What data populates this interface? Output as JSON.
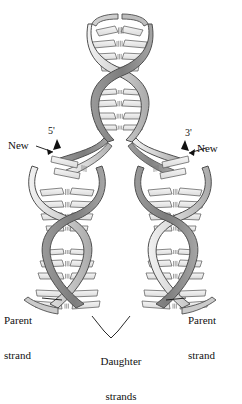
{
  "figure": {
    "background_color": "#ffffff",
    "ink_color": "#111111",
    "ribbon": {
      "outline_color": "#5a5a5a",
      "light_fill": "#d9d9d9",
      "mid_fill": "#b5b5b5",
      "dark_fill": "#8a8a8a",
      "shadow_fill": "#6f6f6f"
    },
    "base_pair": {
      "bar_fill": "#ededed",
      "bar_outline": "#555555",
      "hbond_color": "#777777"
    }
  },
  "labels": {
    "new_left": "New",
    "five_prime": "5'",
    "new_right": "New",
    "three_prime": "3'",
    "parent_left_line1": "Parent",
    "parent_left_line2": "strand",
    "parent_right_line1": "Parent",
    "parent_right_line2": "strand",
    "daughter_line1": "Daughter",
    "daughter_line2": "strands"
  },
  "structure": {
    "parent_duplex_top": "unreplicated parent double helix",
    "fork_y": 175,
    "daughter_left": "left daughter double helix",
    "daughter_right": "right daughter double helix",
    "turns_top": 2,
    "turns_daughter": 2
  }
}
